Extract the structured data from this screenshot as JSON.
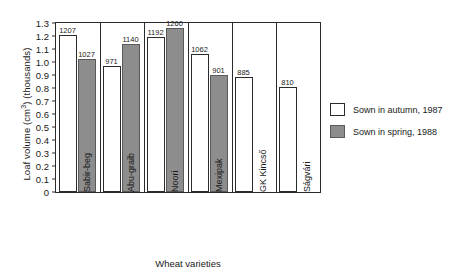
{
  "chart_data": {
    "type": "bar",
    "title": "",
    "xlabel": "Wheat varieties",
    "ylabel": "Loaf volume (cm³) (thousands)",
    "ylabel_main": "Loaf volume (cm",
    "ylabel_sup": "3",
    "ylabel_tail": ") (thousands)",
    "categories": [
      "Sabir-beg",
      "Abu-graib",
      "Noori",
      "Mexipak",
      "GK Kincső",
      "Ságvári"
    ],
    "series": [
      {
        "name": "Sown in autumn, 1987",
        "color": "#ffffff",
        "values": [
          1207,
          971,
          1192,
          1062,
          885,
          810
        ],
        "labels": [
          "1207",
          "971",
          "1192",
          "1062",
          "885",
          "810"
        ]
      },
      {
        "name": "Sown in spring, 1988",
        "color": "#8d8d8d",
        "values": [
          1027,
          1140,
          1260,
          901,
          null,
          null
        ],
        "labels": [
          "1027",
          "1140",
          "1260",
          "901",
          "",
          ""
        ]
      }
    ],
    "ylim": [
      0,
      1.3
    ],
    "yticks": [
      "1.3",
      "1.2",
      "1.1",
      "1.0",
      "0.9",
      "0.8",
      "0.7",
      "0.6",
      "0.5",
      "0.4",
      "0.3",
      "0.2",
      "0.1",
      "0"
    ],
    "ytick_values": [
      1.3,
      1.2,
      1.1,
      1.0,
      0.9,
      0.8,
      0.7,
      0.6,
      0.5,
      0.4,
      0.3,
      0.2,
      0.1,
      0
    ],
    "grid": false,
    "legend_position": "right",
    "units_note": "values in cm³, axis scaled in thousands"
  }
}
